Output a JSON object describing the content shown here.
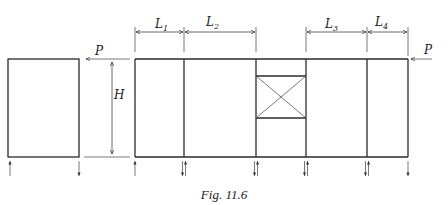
{
  "figure": {
    "caption": "Fig. 11.6",
    "labels": {
      "load_left": "P",
      "load_right": "P",
      "height": "H",
      "spans": [
        {
          "main": "L",
          "sub": "1"
        },
        {
          "main": "L",
          "sub": "2"
        },
        {
          "main": "L",
          "sub": "3"
        },
        {
          "main": "L",
          "sub": "4"
        }
      ]
    },
    "single_frame": {
      "base_reactions": [
        "up",
        "down"
      ]
    },
    "multi_bay_frame": {
      "bays": 5,
      "braced_bay_index": 2,
      "base_reactions": [
        "up",
        "down-up",
        "down-up",
        "down-up",
        "down-up",
        "down"
      ]
    }
  }
}
